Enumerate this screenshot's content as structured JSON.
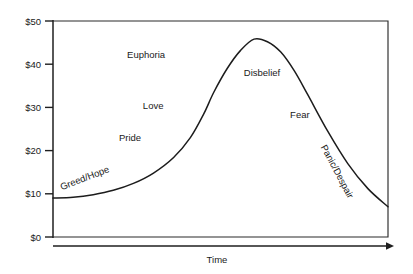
{
  "chart_data": {
    "type": "line",
    "title": "",
    "xlabel": "Time",
    "ylabel": "",
    "xlim": [
      0,
      100
    ],
    "ylim": [
      0,
      50
    ],
    "grid": false,
    "legend": "none",
    "y_ticks": [
      "$0",
      "$10",
      "$20",
      "$30",
      "$40",
      "$50"
    ],
    "y_tick_values": [
      0,
      10,
      20,
      30,
      40,
      50
    ],
    "x_ticks": [],
    "series": [
      {
        "name": "Market Price",
        "x": [
          0,
          6,
          12,
          18,
          24,
          30,
          36,
          41,
          45,
          48,
          52,
          56,
          60,
          64,
          68,
          72,
          76,
          82,
          88,
          94,
          100
        ],
        "values": [
          9.0,
          9.2,
          9.8,
          10.8,
          12.4,
          14.8,
          18.4,
          23.0,
          28.5,
          33.5,
          39.0,
          43.2,
          45.8,
          45.2,
          42.8,
          38.5,
          33.0,
          24.5,
          17.0,
          11.2,
          7.0
        ]
      }
    ],
    "annotations": [
      {
        "text": "Greed/Hope",
        "x_pct": 9.8,
        "y_px": 181,
        "rotation": -21
      },
      {
        "text": "Pride",
        "x_pct": 23.0,
        "y_px": 141,
        "rotation": 0
      },
      {
        "text": "Love",
        "x_pct": 29.9,
        "y_px": 109,
        "rotation": 0
      },
      {
        "text": "Euphoria",
        "x_pct": 27.8,
        "y_px": 58,
        "rotation": 0
      },
      {
        "text": "Disbelief",
        "x_pct": 62.4,
        "y_px": 76,
        "rotation": 0
      },
      {
        "text": "Fear",
        "x_pct": 73.7,
        "y_px": 118,
        "rotation": 0
      },
      {
        "text": "Panic/Despair",
        "x_pct": 84.0,
        "y_px": 173,
        "rotation": 62
      }
    ]
  },
  "axis": {
    "x_title": "Time"
  }
}
